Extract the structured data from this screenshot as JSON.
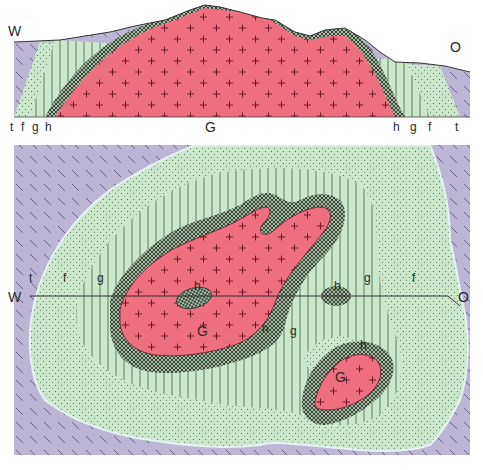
{
  "figure": {
    "colors": {
      "granite": "#ee7080",
      "hornfels_hatch": "#3a4a3a",
      "aureole_green": "#cbe8cc",
      "country_rock": "#bcb6d4",
      "country_rock_stroke": "#6b6488",
      "cross_mark": "#6a1a2a",
      "line": "#333333"
    }
  },
  "cross_section": {
    "west_label": "W",
    "east_label": "O",
    "center_label": "G",
    "bottom_labels_left": [
      "t",
      "f",
      "g",
      "h"
    ],
    "bottom_labels_right": [
      "h",
      "g",
      "f",
      "t"
    ]
  },
  "map_view": {
    "section_line_west": "W",
    "section_line_east": "O",
    "zone_labels_left": [
      "t",
      "f",
      "g"
    ],
    "zone_labels_right": [
      "g",
      "f"
    ],
    "main_pluton_label": "G",
    "main_pluton_hornfels_label": "h",
    "inner_hornfels_label": "h",
    "small_hornfels_label": "h",
    "g_label_mid": "g",
    "second_pluton_label": "G",
    "second_pluton_hornfels_label": "h"
  },
  "legend_key": {
    "G": "granite (plus-sign pattern, pink)",
    "h": "hornfels (crosshatch)",
    "g": "inner aureole (vertical lines, pale green)",
    "f": "outer aureole (dotted, pale green)",
    "t": "unaltered country rock (diagonal dashes, lavender)"
  }
}
